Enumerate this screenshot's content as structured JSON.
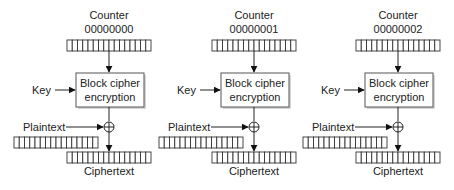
{
  "diagram": {
    "stages": [
      {
        "counter_label": "Counter",
        "counter_value": "00000000",
        "key_label": "Key",
        "block_label_1": "Block cipher",
        "block_label_2": "encryption",
        "plaintext_label": "Plaintext",
        "ciphertext_label": "Ciphertext"
      },
      {
        "counter_label": "Counter",
        "counter_value": "00000001",
        "key_label": "Key",
        "block_label_1": "Block cipher",
        "block_label_2": "encryption",
        "plaintext_label": "Plaintext",
        "ciphertext_label": "Ciphertext"
      },
      {
        "counter_label": "Counter",
        "counter_value": "00000002",
        "key_label": "Key",
        "block_label_1": "Block cipher",
        "block_label_2": "encryption",
        "plaintext_label": "Plaintext",
        "ciphertext_label": "Ciphertext"
      }
    ],
    "register_cells": 16,
    "xor_symbol": "⊕"
  }
}
